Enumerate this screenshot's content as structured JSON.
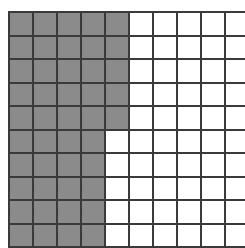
{
  "grid": {
    "rows": 10,
    "columns": 10,
    "shaded_per_row": [
      5,
      5,
      5,
      5,
      5,
      4,
      4,
      4,
      4,
      4
    ],
    "shaded_total": 45,
    "total_cells": 100,
    "colors": {
      "shaded": "#8b8b8b",
      "unshaded": "#ffffff",
      "line": "#3a3a3a"
    }
  }
}
